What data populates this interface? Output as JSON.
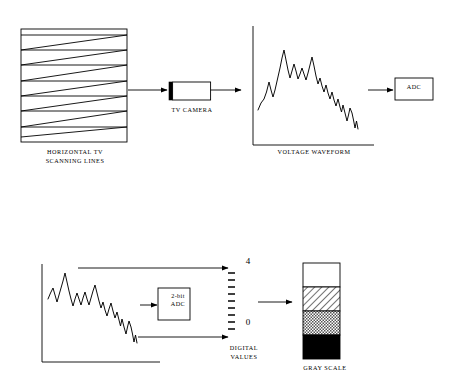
{
  "diagram": {
    "stroke_color": "#000000",
    "background_color": "#ffffff"
  },
  "row_top": {
    "scan_raster": {
      "label": "HORIZONTAL TV\nSCANNING LINES",
      "line_count": 7
    },
    "camera": {
      "label": "TV CAMERA",
      "lens_color": "#000000",
      "body_color": "#ffffff"
    },
    "waveform": {
      "label": "VOLTAGE WAVEFORM"
    },
    "adc": {
      "label": "ADC"
    }
  },
  "row_bottom": {
    "waveform": {
      "label": ""
    },
    "adc": {
      "label_line1": "2-bit",
      "label_line2": "ADC"
    },
    "digital_scale": {
      "label": "DIGITAL\nVALUES",
      "max_value": "4",
      "min_value": "0",
      "tick_count": 9
    },
    "gray_scale": {
      "label": "GRAY SCALE",
      "bands": [
        {
          "name": "white",
          "fill": "#ffffff",
          "pattern": "solid"
        },
        {
          "name": "light-hatch",
          "fill": "#ffffff",
          "pattern": "diagonal-hatch"
        },
        {
          "name": "mid-gray-stipple",
          "fill": "#b8b8b8",
          "pattern": "checker"
        },
        {
          "name": "black",
          "fill": "#000000",
          "pattern": "solid"
        }
      ]
    }
  }
}
